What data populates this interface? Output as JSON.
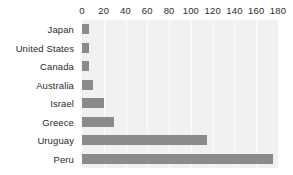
{
  "chart_data": {
    "type": "bar",
    "orientation": "horizontal",
    "title": "",
    "subtitle": "",
    "xlabel": "",
    "ylabel": "",
    "categories": [
      "Japan",
      "United States",
      "Canada",
      "Australia",
      "Israel",
      "Greece",
      "Uruguay",
      "Peru"
    ],
    "values": [
      6,
      6,
      6,
      10,
      20,
      29,
      115,
      175
    ],
    "series": [
      {
        "name": "value",
        "values": [
          6,
          6,
          6,
          10,
          20,
          29,
          115,
          175
        ]
      }
    ],
    "xlim": [
      0,
      180
    ],
    "ylim": null,
    "xticks": [
      0,
      20,
      40,
      60,
      80,
      100,
      120,
      140,
      160,
      180
    ],
    "xtick_labels": [
      "0",
      "20",
      "40",
      "60",
      "80",
      "100",
      "120",
      "140",
      "160",
      "180"
    ],
    "xaxis_position": "top",
    "grid": true,
    "grid_axis": "x",
    "legend": false,
    "legend_position": "none",
    "annotations": [],
    "colors": {
      "bar": "#8b8b8b",
      "plot_background": "#f1f1f1",
      "gridline": "#fdfdfd",
      "figure_background": "#ffffff",
      "text": "#2b2b2b"
    }
  }
}
